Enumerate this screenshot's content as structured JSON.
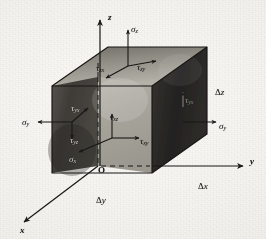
{
  "figure": {
    "kind": "stress-element-diagram",
    "colors": {
      "paper": "#f2f1ee",
      "ink": "#1a1a1a",
      "face_top": "#8a8780",
      "face_front": "#a9a69e",
      "face_left": "#3f3d39",
      "face_right": "#2a2826",
      "label_on_dark": "#d8d4cc"
    }
  },
  "axes": [
    {
      "id": "z",
      "label": "z",
      "direction": "up",
      "x": 108,
      "y": 13
    },
    {
      "id": "y",
      "label": "y",
      "direction": "right",
      "x": 250,
      "y": 157
    },
    {
      "id": "x",
      "label": "x",
      "direction": "down-left",
      "x": 20,
      "y": 226
    }
  ],
  "origin": {
    "label": "O",
    "x": 98,
    "y": 166
  },
  "stresses": [
    {
      "id": "sigma-z",
      "sym": "σ",
      "sub": "z",
      "face": "top",
      "type": "normal",
      "x": 131,
      "y": 25
    },
    {
      "id": "tau-zx",
      "sym": "τ",
      "sub": "zx",
      "face": "top",
      "type": "shear",
      "x": 96,
      "y": 64
    },
    {
      "id": "tau-zy",
      "sym": "τ",
      "sub": "zy",
      "face": "top",
      "type": "shear",
      "x": 137,
      "y": 63
    },
    {
      "id": "sigma-y-left",
      "sym": "σ",
      "sub": "y",
      "face": "left",
      "type": "normal",
      "x": 22,
      "y": 118
    },
    {
      "id": "tau-yx",
      "sym": "τ",
      "sub": "yx",
      "face": "left",
      "type": "shear",
      "x": 71,
      "y": 104
    },
    {
      "id": "tau-yz",
      "sym": "τ",
      "sub": "yz",
      "face": "left",
      "type": "shear",
      "x": 70,
      "y": 136
    },
    {
      "id": "sigma-x",
      "sym": "σ",
      "sub": "x",
      "face": "front",
      "type": "normal",
      "x": 69,
      "y": 155
    },
    {
      "id": "tau-xz",
      "sym": "τ",
      "sub": "xz",
      "face": "front",
      "type": "shear",
      "x": 110,
      "y": 113
    },
    {
      "id": "tau-xy",
      "sym": "τ",
      "sub": "xy",
      "face": "front",
      "type": "shear",
      "x": 140,
      "y": 137
    },
    {
      "id": "sigma-y-right",
      "sym": "σ",
      "sub": "y",
      "face": "right",
      "type": "normal",
      "x": 219,
      "y": 122
    },
    {
      "id": "tau-yx-right",
      "sym": "τ",
      "sub": "yx",
      "face": "right",
      "type": "shear",
      "x": 185,
      "y": 96
    }
  ],
  "dimensions": [
    {
      "id": "delta-z",
      "prefix": "Δ",
      "value": "z",
      "x": 215,
      "y": 88
    },
    {
      "id": "delta-x",
      "prefix": "Δ",
      "value": "x",
      "x": 198,
      "y": 182
    },
    {
      "id": "delta-y",
      "prefix": "Δ",
      "value": "y",
      "x": 96,
      "y": 196
    }
  ]
}
